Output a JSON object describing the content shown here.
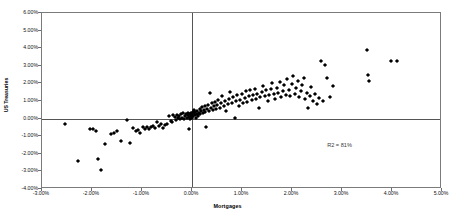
{
  "chart_data": {
    "type": "scatter",
    "title": "",
    "xlabel": "Mortgages",
    "ylabel": "US Treasuries",
    "xlim": [
      -0.03,
      0.05
    ],
    "ylim": [
      -0.04,
      0.06
    ],
    "xticks": [
      "-3.00%",
      "-2.00%",
      "-1.00%",
      "0.00%",
      "1.00%",
      "2.00%",
      "3.00%",
      "4.00%",
      "5.00%"
    ],
    "xtick_values": [
      -0.03,
      -0.02,
      -0.01,
      0.0,
      0.01,
      0.02,
      0.03,
      0.04,
      0.05
    ],
    "yticks": [
      "6.00%",
      "5.00%",
      "4.00%",
      "3.00%",
      "2.00%",
      "1.00%",
      "0.00%",
      "-1.00%",
      "-2.00%",
      "-3.00%",
      "-4.00%"
    ],
    "ytick_values": [
      0.06,
      0.05,
      0.04,
      0.03,
      0.02,
      0.01,
      0.0,
      -0.01,
      -0.02,
      -0.03,
      -0.04
    ],
    "grid": false,
    "legend": "none",
    "marker": "diamond",
    "marker_color": "#000000",
    "annotations": [
      {
        "text": "R2 = 81%",
        "x": 0.0295,
        "y": -0.015
      }
    ],
    "series": [
      {
        "name": "Mortgages vs US Treasuries",
        "points": [
          [
            -0.0255,
            -0.003
          ],
          [
            -0.0228,
            -0.0243
          ],
          [
            -0.0205,
            -0.0058
          ],
          [
            -0.0198,
            -0.006
          ],
          [
            -0.0192,
            -0.0072
          ],
          [
            -0.0188,
            -0.023
          ],
          [
            -0.0182,
            -0.029
          ],
          [
            -0.0175,
            -0.0143
          ],
          [
            -0.0162,
            -0.009
          ],
          [
            -0.0156,
            -0.0083
          ],
          [
            -0.015,
            -0.007
          ],
          [
            -0.0143,
            -0.0128
          ],
          [
            -0.013,
            -0.0008
          ],
          [
            -0.0124,
            -0.0138
          ],
          [
            -0.0118,
            -0.0055
          ],
          [
            -0.0112,
            -0.0073
          ],
          [
            -0.0108,
            -0.0062
          ],
          [
            -0.0104,
            -0.008
          ],
          [
            -0.0098,
            -0.0045
          ],
          [
            -0.0094,
            -0.006
          ],
          [
            -0.009,
            -0.005
          ],
          [
            -0.0086,
            -0.0057
          ],
          [
            -0.0082,
            -0.0048
          ],
          [
            -0.0078,
            -0.0044
          ],
          [
            -0.0074,
            -0.0055
          ],
          [
            -0.007,
            -0.002
          ],
          [
            -0.0066,
            -0.004
          ],
          [
            -0.0062,
            -0.003
          ],
          [
            -0.0058,
            -0.0052
          ],
          [
            -0.0054,
            -0.0035
          ],
          [
            -0.005,
            -0.0028
          ],
          [
            -0.0046,
            0.0015
          ],
          [
            -0.0043,
            -0.0012
          ],
          [
            -0.004,
            -0.0022
          ],
          [
            -0.0038,
            0.0022
          ],
          [
            -0.0035,
            0.0008
          ],
          [
            -0.0032,
            -0.001
          ],
          [
            -0.003,
            0.0018
          ],
          [
            -0.0028,
            0.0002
          ],
          [
            -0.0026,
            0.0012
          ],
          [
            -0.0024,
            -0.0005
          ],
          [
            -0.0022,
            0.0025
          ],
          [
            -0.002,
            0.0006
          ],
          [
            -0.0018,
            0.003
          ],
          [
            -0.0016,
            -0.0002
          ],
          [
            -0.0014,
            0.0014
          ],
          [
            -0.0012,
            0.0028
          ],
          [
            -0.001,
            0.0004
          ],
          [
            -0.0009,
            0.002
          ],
          [
            -0.0008,
            0.0034
          ],
          [
            -0.0007,
            -0.006
          ],
          [
            -0.0006,
            0.001
          ],
          [
            -0.0005,
            0.0026
          ],
          [
            -0.0004,
            0.0
          ],
          [
            -0.0003,
            0.0016
          ],
          [
            -0.0002,
            0.0032
          ],
          [
            -0.0001,
            0.0006
          ],
          [
            0.0,
            0.0022
          ],
          [
            0.0001,
            0.004
          ],
          [
            0.0002,
            0.0012
          ],
          [
            0.0003,
            0.003
          ],
          [
            0.0004,
            0.005
          ],
          [
            0.0005,
            0.0018
          ],
          [
            0.0006,
            0.0036
          ],
          [
            0.0008,
            0.0005
          ],
          [
            0.0009,
            0.0026
          ],
          [
            0.001,
            0.0045
          ],
          [
            0.0012,
            0.0014
          ],
          [
            0.0013,
            0.0033
          ],
          [
            0.0015,
            0.0056
          ],
          [
            0.0016,
            0.0024
          ],
          [
            0.0018,
            0.0042
          ],
          [
            0.002,
            0.0065
          ],
          [
            0.0021,
            0.003
          ],
          [
            0.0023,
            0.0048
          ],
          [
            0.0025,
            0.0072
          ],
          [
            0.0026,
            0.0036
          ],
          [
            0.0028,
            -0.0045
          ],
          [
            0.003,
            0.0055
          ],
          [
            0.0032,
            0.008
          ],
          [
            0.0033,
            0.0042
          ],
          [
            0.0035,
            0.0145
          ],
          [
            0.0037,
            0.0062
          ],
          [
            0.0039,
            0.0088
          ],
          [
            0.0041,
            0.0048
          ],
          [
            0.0043,
            0.007
          ],
          [
            0.0045,
            0.0095
          ],
          [
            0.0047,
            0.0054
          ],
          [
            0.005,
            0.0078
          ],
          [
            0.0052,
            0.0105
          ],
          [
            0.0055,
            0.006
          ],
          [
            0.0058,
            0.0086
          ],
          [
            0.006,
            0.0128
          ],
          [
            0.0063,
            0.007
          ],
          [
            0.0066,
            0.0098
          ],
          [
            0.0068,
            0.0046
          ],
          [
            0.0071,
            0.0082
          ],
          [
            0.0074,
            0.0112
          ],
          [
            0.0076,
            0.015
          ],
          [
            0.0079,
            0.009
          ],
          [
            0.0082,
            0.012
          ],
          [
            0.0085,
            0.0006
          ],
          [
            0.0088,
            0.01
          ],
          [
            0.009,
            0.0135
          ],
          [
            0.0093,
            0.0074
          ],
          [
            0.0096,
            0.0108
          ],
          [
            0.0099,
            0.0142
          ],
          [
            0.0102,
            0.0088
          ],
          [
            0.0105,
            0.0118
          ],
          [
            0.0108,
            0.0155
          ],
          [
            0.011,
            0.0096
          ],
          [
            0.0113,
            0.0126
          ],
          [
            0.0116,
            0.0165
          ],
          [
            0.0119,
            0.0104
          ],
          [
            0.0122,
            0.0134
          ],
          [
            0.0125,
            0.017
          ],
          [
            0.0128,
            0.011
          ],
          [
            0.013,
            0.014
          ],
          [
            0.0133,
            0.0058
          ],
          [
            0.0136,
            0.012
          ],
          [
            0.0139,
            0.0152
          ],
          [
            0.0142,
            0.0185
          ],
          [
            0.0145,
            0.0128
          ],
          [
            0.0148,
            0.016
          ],
          [
            0.0151,
            0.01
          ],
          [
            0.0154,
            0.0134
          ],
          [
            0.0157,
            0.0168
          ],
          [
            0.016,
            0.0205
          ],
          [
            0.0163,
            0.0142
          ],
          [
            0.0166,
            0.0112
          ],
          [
            0.0169,
            0.0176
          ],
          [
            0.0172,
            0.0148
          ],
          [
            0.0175,
            0.021
          ],
          [
            0.0178,
            0.012
          ],
          [
            0.0181,
            0.0158
          ],
          [
            0.0184,
            0.019
          ],
          [
            0.0187,
            0.0132
          ],
          [
            0.019,
            0.0225
          ],
          [
            0.0193,
            0.0164
          ],
          [
            0.0196,
            0.0128
          ],
          [
            0.0199,
            0.0196
          ],
          [
            0.0202,
            0.024
          ],
          [
            0.0205,
            0.0142
          ],
          [
            0.0208,
            0.0175
          ],
          [
            0.0211,
            0.0212
          ],
          [
            0.0214,
            0.012
          ],
          [
            0.0217,
            0.0155
          ],
          [
            0.022,
            0.019
          ],
          [
            0.0223,
            0.0232
          ],
          [
            0.0226,
            0.011
          ],
          [
            0.0229,
            0.0145
          ],
          [
            0.0232,
            0.006
          ],
          [
            0.0235,
            0.0128
          ],
          [
            0.0238,
            0.0178
          ],
          [
            0.0242,
            0.0102
          ],
          [
            0.0246,
            0.014
          ],
          [
            0.025,
            0.0085
          ],
          [
            0.0254,
            0.0118
          ],
          [
            0.0258,
            0.033
          ],
          [
            0.0262,
            0.0098
          ],
          [
            0.0266,
            0.0305
          ],
          [
            0.027,
            0.023
          ],
          [
            0.0276,
            0.0122
          ],
          [
            0.0282,
            0.0185
          ],
          [
            0.035,
            0.039
          ],
          [
            0.0352,
            0.025
          ],
          [
            0.0354,
            0.0212
          ],
          [
            0.0398,
            0.0328
          ],
          [
            0.041,
            0.0326
          ]
        ]
      }
    ]
  }
}
